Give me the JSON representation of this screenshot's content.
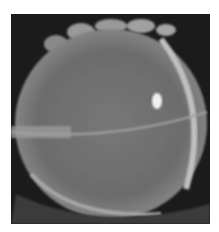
{
  "image": {
    "subject": "eye with contact lens (grayscale slit-lamp photograph)",
    "colors": {
      "background": "#ffffff",
      "frame": "#1a1a1a",
      "lens": "#7a7a7a",
      "lens_edge": "#b8b8b8",
      "highlight": "#f0f0f0"
    }
  }
}
